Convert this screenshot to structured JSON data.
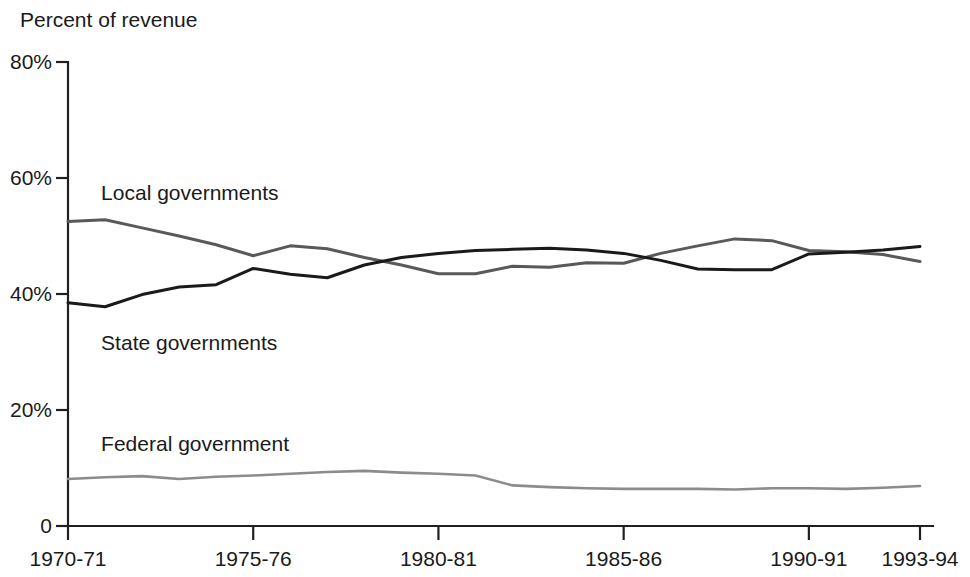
{
  "chart_data": {
    "type": "line",
    "title": "",
    "subtitle": "",
    "xlabel": "",
    "ylabel": "Percent of revenue",
    "ylim": [
      0,
      80
    ],
    "xlim": [
      "1970-71",
      "1993-94"
    ],
    "grid": false,
    "legend_position": "inline-labels",
    "y_ticks": [
      "0",
      "20%",
      "40%",
      "60%",
      "80%"
    ],
    "y_tick_values": [
      0,
      20,
      40,
      60,
      80
    ],
    "x_ticks": [
      "1970-71",
      "1975-76",
      "1980-81",
      "1985-86",
      "1990-91",
      "1993-94"
    ],
    "x_tick_values": [
      1970,
      1975,
      1980,
      1985,
      1990,
      1993
    ],
    "x": [
      1970,
      1971,
      1972,
      1973,
      1974,
      1975,
      1976,
      1977,
      1978,
      1979,
      1980,
      1981,
      1982,
      1983,
      1984,
      1985,
      1986,
      1987,
      1988,
      1989,
      1990,
      1991,
      1992,
      1993
    ],
    "series": [
      {
        "name": "Local governments",
        "color": "#595959",
        "label_x": 1970.3,
        "label_y": 57.5,
        "values": [
          52.5,
          52.8,
          51.4,
          50.0,
          48.5,
          46.6,
          48.3,
          47.8,
          46.3,
          45.0,
          43.5,
          43.5,
          44.8,
          44.6,
          45.4,
          45.3,
          47.0,
          48.3,
          49.5,
          49.2,
          47.5,
          47.3,
          46.8,
          45.6
        ]
      },
      {
        "name": "State governments",
        "color": "#1a1a1a",
        "label_x": 1970.3,
        "label_y": 31.5,
        "values": [
          38.5,
          37.8,
          39.9,
          41.2,
          41.6,
          44.4,
          43.4,
          42.8,
          45.0,
          46.3,
          47.0,
          47.5,
          47.7,
          47.9,
          47.6,
          47.0,
          45.8,
          44.3,
          44.2,
          44.2,
          46.9,
          47.2,
          47.6,
          48.2
        ]
      },
      {
        "name": "Federal government",
        "color": "#8c8c8c",
        "label_x": 1970.3,
        "label_y": 14.2,
        "values": [
          8.1,
          8.4,
          8.6,
          8.1,
          8.5,
          8.7,
          9.0,
          9.3,
          9.5,
          9.2,
          9.0,
          8.7,
          7.0,
          6.7,
          6.5,
          6.4,
          6.4,
          6.4,
          6.3,
          6.5,
          6.5,
          6.4,
          6.6,
          6.9
        ]
      }
    ]
  }
}
